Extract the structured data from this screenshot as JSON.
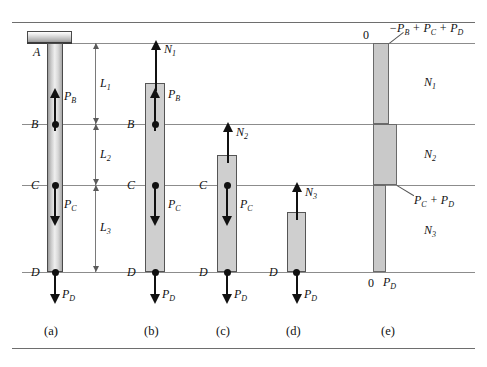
{
  "figure": {
    "colors": {
      "bar_fill": "#cfcfcf",
      "line": "#8c8c8c",
      "arrow": "#111111",
      "support_fill": "#b9b9b9"
    }
  },
  "points": {
    "A": "A",
    "B": "B",
    "C": "C",
    "D": "D"
  },
  "dimensions": {
    "L1": "L",
    "L1_sub": "1",
    "L2": "L",
    "L2_sub": "2",
    "L3": "L",
    "L3_sub": "3"
  },
  "loads": {
    "PB": "P",
    "PB_sub": "B",
    "PC": "P",
    "PC_sub": "C",
    "PD": "P",
    "PD_sub": "D"
  },
  "internal_forces": {
    "N1": "N",
    "N1_sub": "1",
    "N2": "N",
    "N2_sub": "2",
    "N3": "N",
    "N3_sub": "3"
  },
  "axial_force_diagram": {
    "zero_top": "0",
    "zero_bottom": "0",
    "value_segment1": "−P",
    "value_segment1_sub": "B",
    "value_segment1_rest": " + P",
    "value_segment1_sub2": "C",
    "value_segment1_rest2": " + P",
    "value_segment1_sub3": "D",
    "value_segment2": "P",
    "value_segment2_sub": "C",
    "value_segment2_rest": " + P",
    "value_segment2_sub2": "D",
    "value_segment3": "P",
    "value_segment3_sub": "D",
    "region1": "N",
    "region1_sub": "1",
    "region2": "N",
    "region2_sub": "2",
    "region3": "N",
    "region3_sub": "3"
  },
  "captions": {
    "a": "(a)",
    "b": "(b)",
    "c": "(c)",
    "d": "(d)",
    "e": "(e)"
  }
}
